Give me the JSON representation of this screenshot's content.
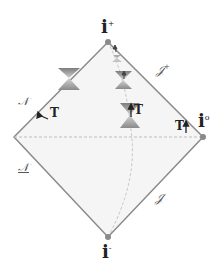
{
  "diagram": {
    "type": "penrose-diagram",
    "colors": {
      "edge": "#8a8a8a",
      "fill": "#f4f4f4",
      "dashed": "#bdbdbd",
      "cone": "#9a9a9a",
      "vertex": "#8a8a8a"
    },
    "labels": {
      "i_plus": "i",
      "i_plus_sup": "+",
      "i_minus": "i",
      "i_minus_sup": "-",
      "i_zero": "i",
      "i_zero_sup": "o",
      "scri_plus": "𝒥",
      "scri_plus_sup": "+",
      "scri_minus": "𝒥",
      "scri_minus_sup": "-",
      "horizon_upper": "𝒩",
      "horizon_lower": "𝒩",
      "t_left": "T",
      "t_center": "T",
      "t_right": "T"
    }
  }
}
